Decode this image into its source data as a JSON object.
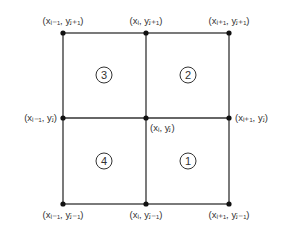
{
  "diagram": {
    "labels": {
      "top_left": "(xᵢ₋₁, yⱼ₊₁)",
      "top_mid": "(xᵢ, yⱼ₊₁)",
      "top_right": "(xᵢ₊₁, yⱼ₊₁)",
      "mid_left": "(xᵢ₋₁, yⱼ)",
      "center": "(xᵢ, yⱼ)",
      "mid_right": "(xᵢ₊₁, yⱼ)",
      "bottom_left": "(xᵢ₋₁, yⱼ₋₁)",
      "bottom_mid": "(xᵢ, yⱼ₋₁)",
      "bottom_right": "(xᵢ₊₁, yⱼ₋₁)"
    },
    "quadrants": {
      "q1": "1",
      "q2": "2",
      "q3": "3",
      "q4": "4"
    }
  }
}
